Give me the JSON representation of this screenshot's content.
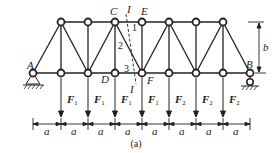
{
  "diagram": {
    "type": "truss",
    "caption": "(a)",
    "colors": {
      "line": "#222222",
      "background": "#ffffff",
      "node_fill": "#ffffff"
    },
    "geometry": {
      "panels": 8,
      "panel_width_label": "a",
      "height_label": "b",
      "bottom_chord_y": 73,
      "top_chord_y": 22,
      "x0": 33,
      "dx": 27
    },
    "node_labels": {
      "A": "A",
      "B": "B",
      "C": "C",
      "D": "D",
      "E": "E",
      "F": "F"
    },
    "section": {
      "label_top": "I",
      "label_bottom": "I",
      "member_numbers": [
        "1",
        "2",
        "3"
      ]
    },
    "loads": [
      {
        "node": 1,
        "symbol": "F",
        "subscript": "1"
      },
      {
        "node": 2,
        "symbol": "F",
        "subscript": "1"
      },
      {
        "node": 3,
        "symbol": "F",
        "subscript": "1"
      },
      {
        "node": 4,
        "symbol": "F",
        "subscript": "1"
      },
      {
        "node": 5,
        "symbol": "F",
        "subscript": "2"
      },
      {
        "node": 6,
        "symbol": "F",
        "subscript": "2"
      },
      {
        "node": 7,
        "symbol": "F",
        "subscript": "2"
      }
    ],
    "dimensions": [
      "a",
      "a",
      "a",
      "a",
      "a",
      "a",
      "a",
      "a"
    ],
    "supports": {
      "left": "pin support at A",
      "right": "roller support at B"
    }
  }
}
